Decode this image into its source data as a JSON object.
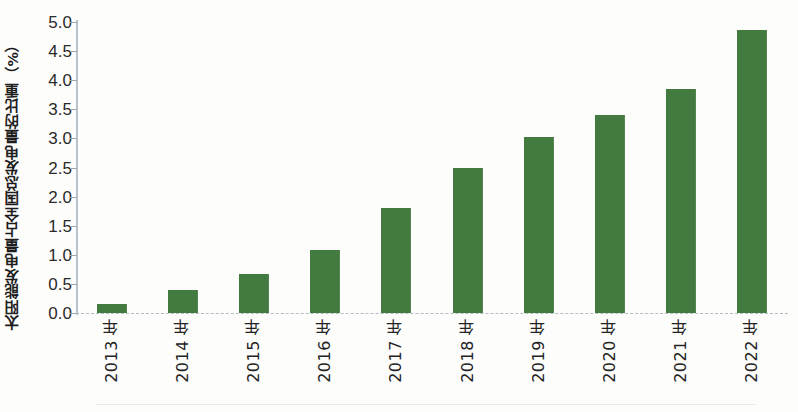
{
  "chart_data": {
    "type": "bar",
    "title": "",
    "subtitle": "",
    "xlabel": "",
    "ylabel": "太阳能发电量占全国总发电量的比重（%）",
    "categories": [
      "2013 年",
      "2014 年",
      "2015 年",
      "2016 年",
      "2017 年",
      "2018 年",
      "2019 年",
      "2020 年",
      "2021 年",
      "2022 年"
    ],
    "values": [
      0.15,
      0.4,
      0.67,
      1.08,
      1.8,
      2.5,
      3.02,
      3.4,
      3.85,
      4.87
    ],
    "series": [
      {
        "name": "太阳能发电量占全国总发电量的比重",
        "values": [
          0.15,
          0.4,
          0.67,
          1.08,
          1.8,
          2.5,
          3.02,
          3.4,
          3.85,
          4.87
        ]
      }
    ],
    "ylim": [
      0.0,
      5.0
    ],
    "ytick_step": 0.5,
    "ytick_labels": [
      "0.0",
      "0.5",
      "1.0",
      "1.5",
      "2.0",
      "2.5",
      "3.0",
      "3.5",
      "4.0",
      "4.5",
      "5.0"
    ],
    "ytick_values": [
      0.0,
      0.5,
      1.0,
      1.5,
      2.0,
      2.5,
      3.0,
      3.5,
      4.0,
      4.5,
      5.0
    ],
    "grid": false,
    "legend": null,
    "legend_position": "none",
    "bar_color": "#437a40",
    "axis_color": "#b9c3cc",
    "baseline_color": "#b5bcc3",
    "background_color": "#fdfdfc",
    "annotations": []
  }
}
